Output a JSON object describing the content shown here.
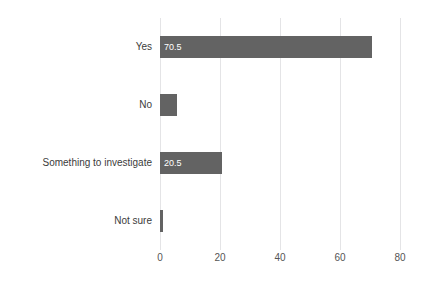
{
  "chart_data": {
    "type": "bar",
    "orientation": "horizontal",
    "title": "",
    "subtitle": "",
    "xlabel": "",
    "ylabel": "",
    "categories": [
      "Yes",
      "No",
      "Something to investigate",
      "Not sure"
    ],
    "values": [
      70.5,
      5.7,
      20.5,
      1.1
    ],
    "value_labels": [
      "70.5",
      "",
      "20.5",
      ""
    ],
    "series": [
      {
        "name": "Response share",
        "values": [
          70.5,
          5.7,
          20.5,
          1.1
        ]
      }
    ],
    "xlim": [
      0,
      80
    ],
    "xticks": [
      0,
      20,
      40,
      60,
      80
    ],
    "xtick_labels": [
      "0",
      "20",
      "40",
      "60",
      "80"
    ],
    "grid": true,
    "grid_axis": "x",
    "legend": false,
    "legend_position": "none",
    "bar_color": "#636363",
    "gridline_color": "#e4e4e6",
    "value_label_color": "#ffffff",
    "category_label_color": "#3b3b3b",
    "tick_label_color": "#555555",
    "background_color": "#ffffff"
  },
  "figure": {
    "clipped_title": "",
    "units_per_pixel": 3
  }
}
